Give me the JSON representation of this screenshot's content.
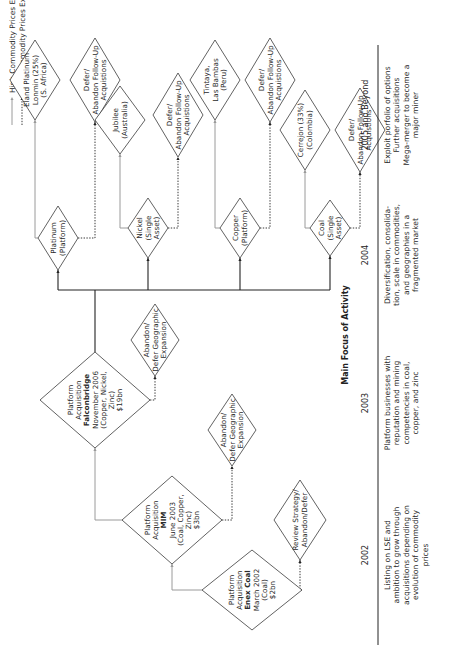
{
  "legend": {
    "high": "High Commodity Prices Expected",
    "low": "Low Commodity Prices Expected"
  },
  "nodes": {
    "enex": {
      "lines": [
        "Platform",
        "Acquisition",
        "Enex Coal",
        "March 2002",
        "(Coal)",
        "$2bn"
      ],
      "bold_index": 2
    },
    "mim": {
      "lines": [
        "Platform",
        "Acquisition",
        "MIM",
        "June 2003",
        "(Coal, Copper,",
        "Zinc)",
        "$3bn"
      ],
      "bold_index": 2
    },
    "falconbridge": {
      "lines": [
        "Platform",
        "Acquisition",
        "Falconbridge",
        "November 2006",
        "(Copper, Nickel,",
        "Zinc)",
        "$19bn"
      ],
      "bold_index": 2
    },
    "review": {
      "lines": [
        "Review Strategy/",
        "Abandon/Defer"
      ]
    },
    "abandon_mim": {
      "lines": [
        "Abandon/",
        "Defer Geographic",
        "Expansion"
      ]
    },
    "abandon_falcon": {
      "lines": [
        "Abandon/",
        "Defer Geographic",
        "Expansion"
      ]
    },
    "platinum": {
      "lines": [
        "Platinum",
        "(Platform)"
      ]
    },
    "nickel": {
      "lines": [
        "Nickel",
        "(Single",
        "Asset)"
      ]
    },
    "copper": {
      "lines": [
        "Copper",
        "(Platform)"
      ]
    },
    "coal": {
      "lines": [
        "Coal",
        "(Single",
        "Asset)"
      ]
    },
    "eland": {
      "lines": [
        "Eland Platinum",
        "Lonmin (25%)",
        "(S. Africa)"
      ]
    },
    "defer_platinum": {
      "lines": [
        "Defer/",
        "Abandon Follow-Up",
        "Acquistions"
      ]
    },
    "jubilee": {
      "lines": [
        "Jubilee",
        "(Australia)"
      ]
    },
    "defer_nickel": {
      "lines": [
        "Defer/",
        "Abandon Follow-Up",
        "Acquistions"
      ]
    },
    "tintaya": {
      "lines": [
        "Tintaya,",
        "Las Bambas",
        "(Peru)"
      ]
    },
    "defer_copper": {
      "lines": [
        "Defer/",
        "Abandon Follow-Up",
        "Acquistions"
      ]
    },
    "cerrejon": {
      "lines": [
        "Cerrejon (33%)",
        "(Colombia)"
      ]
    },
    "defer_coal": {
      "lines": [
        "Defer/",
        "Abandon Follow-Up",
        "Acquistions"
      ]
    }
  },
  "timeline": {
    "title": "Main Focus of Activity",
    "columns": [
      {
        "year": "2002",
        "lines": [
          "Listing on LSE and",
          "ambition to grow through",
          "acquisitions depending on",
          "evolution of commodity",
          "prices"
        ]
      },
      {
        "year": "2003",
        "lines": [
          "Platform businesses with",
          "reputation and mining",
          "competencies in coal,",
          "copper, and zinc"
        ]
      },
      {
        "year": "2004",
        "lines": [
          "Diversification, consolida-",
          "tion, scale in commodities,",
          "and geographies in a",
          "fragmented market"
        ]
      },
      {
        "year": "2005 and Beyond",
        "lines": [
          "Exploit porfolio of options",
          "Further acquisitions",
          "Mega-merger to become a",
          "major miner"
        ]
      }
    ]
  },
  "colors": {
    "high_line": "#9a9a9a",
    "low_line": "#222222",
    "stroke": "#3a3a3a",
    "text": "#2a2a2a"
  }
}
